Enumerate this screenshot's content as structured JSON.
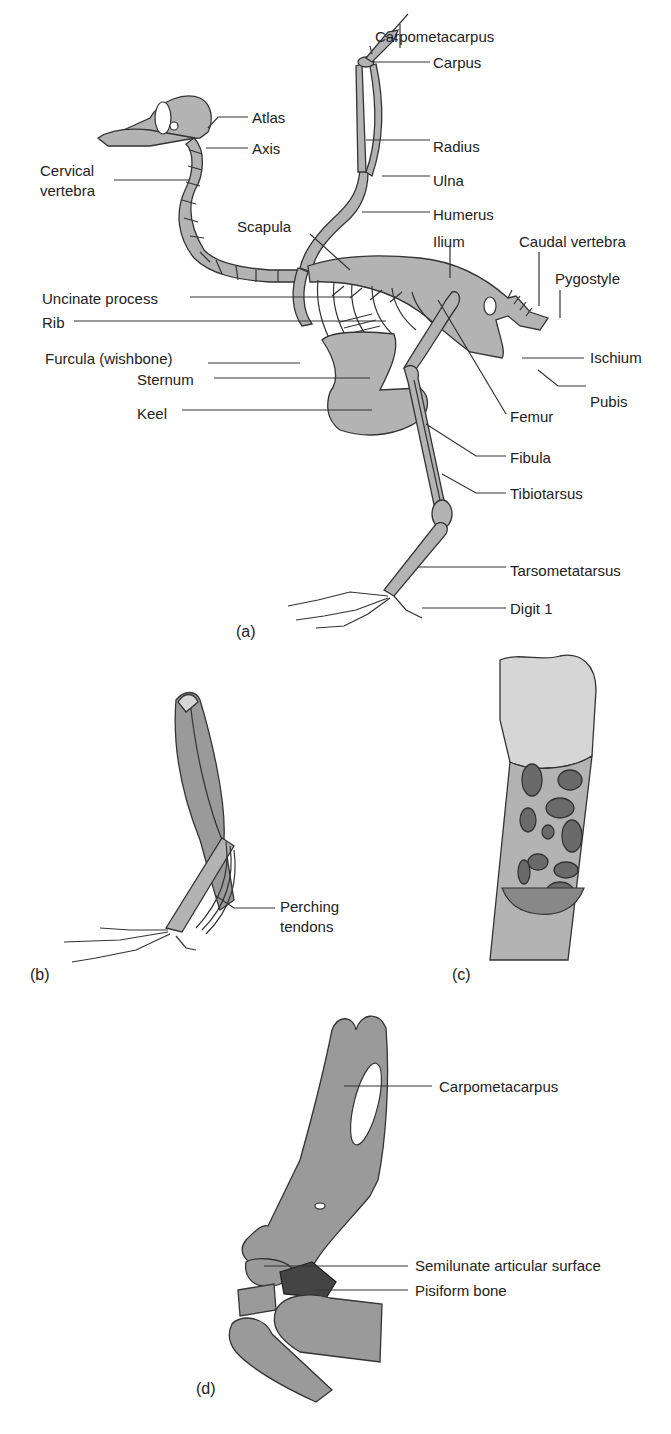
{
  "figure": {
    "panels": [
      {
        "id": "a",
        "panel_label": "(a)",
        "subject": "bird skeleton",
        "labels": [
          "Carpometacarpus",
          "Carpus",
          "Atlas",
          "Axis",
          "Radius",
          "Cervical vertebra",
          "Ulna",
          "Humerus",
          "Scapula",
          "Ilium",
          "Caudal vertebra",
          "Pygostyle",
          "Uncinate process",
          "Rib",
          "Furcula (wishbone)",
          "Ischium",
          "Sternum",
          "Pubis",
          "Keel",
          "Femur",
          "Fibula",
          "Tibiotarsus",
          "Tarsometatarsus",
          "Digit 1"
        ]
      },
      {
        "id": "b",
        "panel_label": "(b)",
        "subject": "leg muscles and tendons",
        "labels": [
          "Perching tendons"
        ]
      },
      {
        "id": "c",
        "panel_label": "(c)",
        "subject": "hollow bone cross-section",
        "labels": []
      },
      {
        "id": "d",
        "panel_label": "(d)",
        "subject": "wrist joint",
        "labels": [
          "Carpometacarpus",
          "Semilunate articular surface",
          "Pisiform bone"
        ]
      }
    ]
  },
  "a": {
    "carpometacarpus": "Carpometacarpus",
    "carpus": "Carpus",
    "atlas": "Atlas",
    "axis": "Axis",
    "radius": "Radius",
    "cervical_1": "Cervical",
    "cervical_2": "vertebra",
    "ulna": "Ulna",
    "humerus": "Humerus",
    "scapula": "Scapula",
    "ilium": "Ilium",
    "caudal": "Caudal vertebra",
    "pygostyle": "Pygostyle",
    "uncinate": "Uncinate process",
    "rib": "Rib",
    "furcula": "Furcula (wishbone)",
    "ischium": "Ischium",
    "sternum": "Sternum",
    "pubis": "Pubis",
    "keel": "Keel",
    "femur": "Femur",
    "fibula": "Fibula",
    "tibiotarsus": "Tibiotarsus",
    "tarsometatarsus": "Tarsometatarsus",
    "digit1": "Digit 1",
    "panel": "(a)"
  },
  "b": {
    "tendons_1": "Perching",
    "tendons_2": "tendons",
    "panel": "(b)"
  },
  "c": {
    "panel": "(c)"
  },
  "d": {
    "carpometacarpus": "Carpometacarpus",
    "semilunate": "Semilunate articular surface",
    "pisiform": "Pisiform bone",
    "panel": "(d)"
  }
}
